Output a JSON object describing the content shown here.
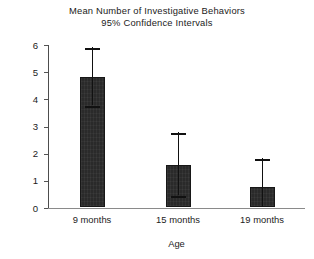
{
  "chart_data": {
    "type": "bar",
    "title": "Mean Number of Investigative Behaviors",
    "subtitle": "95% Confidence Intervals",
    "xlabel": "Age",
    "ylabel": "Mean number of behaviors",
    "categories": [
      "9 months",
      "15 months",
      "19 months"
    ],
    "values": [
      4.8,
      1.55,
      0.73
    ],
    "error_bars": {
      "label": "95% Confidence Intervals",
      "upper": [
        5.9,
        2.75,
        1.8
      ],
      "lower": [
        3.75,
        0.45,
        0.0
      ]
    },
    "ylim": [
      0,
      6
    ],
    "yticks": [
      0,
      1,
      2,
      3,
      4,
      5,
      6
    ],
    "ytick_labels": [
      "0",
      "1",
      "2",
      "3",
      "4",
      "5",
      "6"
    ],
    "grid": false,
    "legend": null,
    "bar_color": "#2a2a2a",
    "axis_color": "#8a8a8a",
    "background": "#ffffff"
  }
}
